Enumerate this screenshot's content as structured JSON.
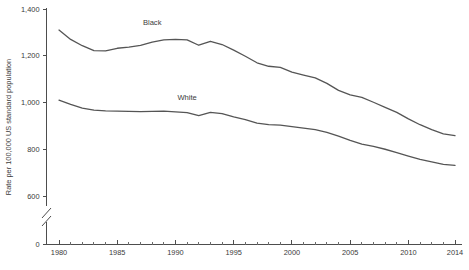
{
  "chart_data": {
    "type": "line",
    "title": "",
    "xlabel": "",
    "ylabel": "Rate per 100,000 US standard population",
    "xlim": [
      1980,
      2014
    ],
    "ylim": [
      560,
      1400
    ],
    "ylim_display": [
      0,
      1400
    ],
    "y_axis_break": true,
    "y_axis_break_between": [
      0,
      560
    ],
    "grid": false,
    "legend_position": "inline-labels",
    "y_ticks": [
      0,
      600,
      800,
      1000,
      1200,
      1400
    ],
    "y_tick_labels": [
      "0",
      "600",
      "800",
      "1,000",
      "1,200",
      "1,400"
    ],
    "x_ticks": [
      1980,
      1985,
      1990,
      1995,
      2000,
      2005,
      2010,
      2014
    ],
    "x_tick_labels": [
      "1980",
      "1985",
      "1990",
      "1995",
      "2000",
      "2005",
      "2010",
      "2014"
    ],
    "x_minor_tick_step": 1,
    "x": [
      1980,
      1981,
      1982,
      1983,
      1984,
      1985,
      1986,
      1987,
      1988,
      1989,
      1990,
      1991,
      1992,
      1993,
      1994,
      1995,
      1996,
      1997,
      1998,
      1999,
      2000,
      2001,
      2002,
      2003,
      2004,
      2005,
      2006,
      2007,
      2008,
      2009,
      2010,
      2011,
      2012,
      2013,
      2014
    ],
    "series": [
      {
        "name": "Black",
        "color": "#555555",
        "label_x": 1988,
        "label_y": 1330,
        "values": [
          1310,
          1270,
          1243,
          1222,
          1221,
          1232,
          1237,
          1244,
          1258,
          1268,
          1270,
          1268,
          1245,
          1262,
          1248,
          1224,
          1198,
          1170,
          1155,
          1150,
          1130,
          1117,
          1105,
          1082,
          1052,
          1033,
          1022,
          1001,
          979,
          958,
          930,
          905,
          884,
          866,
          858
        ]
      },
      {
        "name": "White",
        "color": "#555555",
        "label_x": 1991,
        "label_y": 1012,
        "values": [
          1010,
          992,
          976,
          967,
          964,
          963,
          962,
          961,
          962,
          963,
          960,
          957,
          944,
          958,
          952,
          938,
          927,
          912,
          905,
          903,
          897,
          890,
          884,
          872,
          856,
          838,
          822,
          812,
          800,
          786,
          771,
          757,
          746,
          735,
          731
        ]
      }
    ]
  },
  "axis": {
    "y_title": "Rate per 100,000 US standard population"
  }
}
